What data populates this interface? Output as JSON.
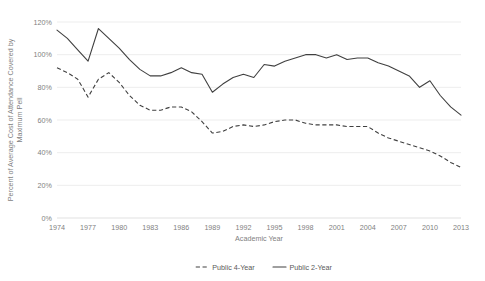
{
  "chart_data": {
    "type": "line",
    "title": "",
    "xlabel": "Academic Year",
    "ylabel": "Percent of Average Cost of Attendance Covered by Maximum Pell",
    "ylabel_line1": "Percent of Average Cost of Attendance Covered by",
    "ylabel_line2": "Maximum Pell",
    "grid": true,
    "legend_position": "bottom-center",
    "ylim": [
      0,
      120
    ],
    "ytick_labels": [
      "120%",
      "100%",
      "80%",
      "60%",
      "40%",
      "20%",
      "0%"
    ],
    "ytick_values": [
      120,
      100,
      80,
      60,
      40,
      20,
      0
    ],
    "xlim": [
      1974,
      2013
    ],
    "xtick_labels": [
      "1974",
      "1977",
      "1980",
      "1983",
      "1986",
      "1989",
      "1992",
      "1995",
      "1998",
      "2001",
      "2004",
      "2007",
      "2010",
      "2013"
    ],
    "xtick_values": [
      1974,
      1977,
      1980,
      1983,
      1986,
      1989,
      1992,
      1995,
      1998,
      2001,
      2004,
      2007,
      2010,
      2013
    ],
    "x": [
      1974,
      1975,
      1976,
      1977,
      1978,
      1979,
      1980,
      1981,
      1982,
      1983,
      1984,
      1985,
      1986,
      1987,
      1988,
      1989,
      1990,
      1991,
      1992,
      1993,
      1994,
      1995,
      1996,
      1997,
      1998,
      1999,
      2000,
      2001,
      2002,
      2003,
      2004,
      2005,
      2006,
      2007,
      2008,
      2009,
      2010,
      2011,
      2012,
      2013
    ],
    "series": [
      {
        "name": "Public 4-Year",
        "style": "dashed",
        "color": "#404040",
        "values": [
          92,
          89,
          85,
          74,
          85,
          89,
          83,
          75,
          69,
          66,
          66,
          68,
          68,
          65,
          59,
          52,
          53,
          56,
          57,
          56,
          57,
          59,
          60,
          60,
          58,
          57,
          57,
          57,
          56,
          56,
          56,
          52,
          49,
          47,
          45,
          43,
          41,
          38,
          34,
          31
        ]
      },
      {
        "name": "Public 2-Year",
        "style": "solid",
        "color": "#404040",
        "values": [
          115,
          110,
          103,
          96,
          116,
          110,
          104,
          97,
          91,
          87,
          87,
          89,
          92,
          89,
          88,
          77,
          82,
          86,
          88,
          86,
          94,
          93,
          96,
          98,
          100,
          100,
          98,
          100,
          97,
          98,
          98,
          95,
          93,
          90,
          87,
          80,
          84,
          75,
          68,
          63
        ]
      }
    ]
  },
  "legend": {
    "items": [
      {
        "label": "Public 4-Year",
        "style": "dashed"
      },
      {
        "label": "Public 2-Year",
        "style": "solid"
      }
    ]
  }
}
